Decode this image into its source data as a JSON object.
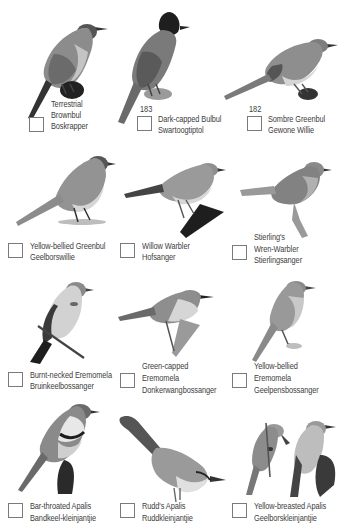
{
  "page": {
    "background": "#ffffff",
    "style": "grayscale field-guide checklist page"
  },
  "species": [
    {
      "row": 1,
      "col": 1,
      "number": "",
      "english_lines": [
        "Terrestrial",
        "Brownbul"
      ],
      "afrikaans": "Boskrapper",
      "checked": false
    },
    {
      "row": 1,
      "col": 2,
      "number": "183",
      "english_lines": [
        "Dark-capped Bulbul"
      ],
      "afrikaans": "Swartoogtiptol",
      "checked": false
    },
    {
      "row": 1,
      "col": 3,
      "number": "182",
      "english_lines": [
        "Sombre Greenbul"
      ],
      "afrikaans": "Gewone Willie",
      "checked": false
    },
    {
      "row": 2,
      "col": 1,
      "number": "",
      "english_lines": [
        "Yellow-bellied Greenbul"
      ],
      "afrikaans": "Geelborswillie",
      "checked": false
    },
    {
      "row": 2,
      "col": 2,
      "number": "",
      "english_lines": [
        "Willow Warbler"
      ],
      "afrikaans": "Hofsanger",
      "checked": false
    },
    {
      "row": 2,
      "col": 3,
      "number": "",
      "english_lines": [
        "Stierling's",
        "Wren-Warbler"
      ],
      "afrikaans": "Stierlingsanger",
      "checked": false
    },
    {
      "row": 3,
      "col": 1,
      "number": "",
      "english_lines": [
        "Burnt-necked Eremomela"
      ],
      "afrikaans": "Bruinkeelbossanger",
      "checked": false
    },
    {
      "row": 3,
      "col": 2,
      "number": "",
      "english_lines": [
        "Green-capped",
        "Eremomela"
      ],
      "afrikaans": "Donkerwangbossanger",
      "checked": false
    },
    {
      "row": 3,
      "col": 3,
      "number": "",
      "english_lines": [
        "Yellow-bellied",
        "Eremomela"
      ],
      "afrikaans": "Geelpensbossanger",
      "checked": false
    },
    {
      "row": 4,
      "col": 1,
      "number": "",
      "english_lines": [
        "Bar-throated Apalis"
      ],
      "afrikaans": "Bandkeel-kleinjantjie",
      "checked": false
    },
    {
      "row": 4,
      "col": 2,
      "number": "",
      "english_lines": [
        "Rudd's Apalis"
      ],
      "afrikaans": "Ruddkleinjantjie",
      "checked": false
    },
    {
      "row": 4,
      "col": 3,
      "number": "",
      "english_lines": [
        "Yellow-breasted Apalis"
      ],
      "afrikaans": "Geelborskleinjantjie",
      "checked": false
    }
  ],
  "labels": {
    "s0_l1": "Terrestrial",
    "s0_l2": "Brownbul",
    "s0_af": "Boskrapper",
    "s1_num": "183",
    "s1_l1": "Dark-capped Bulbul",
    "s1_af": "Swartoogtiptol",
    "s2_num": "182",
    "s2_l1": "Sombre Greenbul",
    "s2_af": "Gewone Willie",
    "s3_l1": "Yellow-bellied Greenbul",
    "s3_af": "Geelborswillie",
    "s4_l1": "Willow Warbler",
    "s4_af": "Hofsanger",
    "s5_l1": "Stierling's",
    "s5_l2": "Wren-Warbler",
    "s5_af": "Stierlingsanger",
    "s6_l1": "Burnt-necked Eremomela",
    "s6_af": "Bruinkeelbossanger",
    "s7_l1": "Green-capped",
    "s7_l2": "Eremomela",
    "s7_af": "Donkerwangbossanger",
    "s8_l1": "Yellow-bellied",
    "s8_l2": "Eremomela",
    "s8_af": "Geelpensbossanger",
    "s9_l1": "Bar-throated Apalis",
    "s9_af": "Bandkeel-kleinjantjie",
    "s10_l1": "Rudd's Apalis",
    "s10_af": "Ruddkleinjantjie",
    "s11_l1": "Yellow-breasted Apalis",
    "s11_af": "Geelborskleinjantjie"
  },
  "colors": {
    "text": "#3d3d3d",
    "checkbox_border": "#7a7a7a",
    "bird_dark": "#2e2e2e",
    "bird_mid": "#8a8a8a",
    "bird_light": "#cfcfcf"
  }
}
